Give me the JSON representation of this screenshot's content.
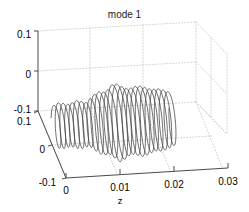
{
  "figure": {
    "title": "mode 1",
    "background_color": "#ffffff",
    "axis_color": "#4d4d4d",
    "grid_color": "#bfbfbf",
    "curve_color": "#404040"
  },
  "chart_data": {
    "type": "line",
    "title": "mode 1",
    "projection": "3d",
    "xlabel": "z",
    "ylabel": "",
    "zlabel": "",
    "grid": true,
    "legend": null,
    "xlim": [
      0,
      0.03
    ],
    "ylim": [
      -0.1,
      0.1
    ],
    "zlim": [
      -0.1,
      0.1
    ],
    "xticks": [
      "0",
      "0.01",
      "0.02",
      "0.03"
    ],
    "yticks": [
      "-0.1",
      "0",
      "0.1"
    ],
    "zticks": [
      "-0.1",
      "0",
      "0.1"
    ],
    "xtick_values": [
      0,
      0.01,
      0.02,
      0.03
    ],
    "ytick_values": [
      -0.1,
      0,
      0.1
    ],
    "ztick_values": [
      -0.1,
      0,
      0.1
    ],
    "series": [
      {
        "name": "mode 1",
        "turns": 26,
        "z_start": 0.0005,
        "z_end": 0.0225,
        "amplitudes": [
          0.03,
          0.034,
          0.033,
          0.031,
          0.033,
          0.036,
          0.034,
          0.032,
          0.038,
          0.044,
          0.047,
          0.045,
          0.05,
          0.058,
          0.055,
          0.05,
          0.048,
          0.05,
          0.052,
          0.05,
          0.047,
          0.045,
          0.046,
          0.044,
          0.041,
          0.038
        ],
        "center_y": -0.055
      }
    ]
  },
  "axes": {
    "x_axis": {
      "name": "z",
      "ticks": [
        {
          "label": "0"
        },
        {
          "label": "0.01"
        },
        {
          "label": "0.02"
        },
        {
          "label": "0.03"
        }
      ]
    },
    "y_axis": {
      "ticks": [
        {
          "label": "0.1"
        },
        {
          "label": "0"
        },
        {
          "label": "-0.1"
        }
      ]
    },
    "depth_axis": {
      "ticks": [
        {
          "label": "0.1"
        },
        {
          "label": "0"
        },
        {
          "label": "-0.1"
        }
      ]
    }
  }
}
